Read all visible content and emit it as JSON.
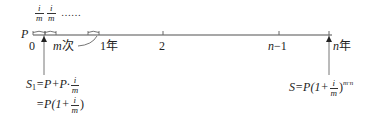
{
  "diagram": {
    "type": "timeline",
    "start_label": "P",
    "top_fractions": [
      {
        "numerator": "i",
        "denominator": "m"
      },
      {
        "numerator": "i",
        "denominator": "m"
      }
    ],
    "top_ellipsis": "……",
    "ticks": [
      {
        "label": "0",
        "x": 37
      },
      {
        "label": "1年",
        "x": 91
      },
      {
        "label": "2",
        "x": 163
      },
      {
        "label": "n−1",
        "x": 278
      },
      {
        "label": "n年",
        "x": 329
      }
    ],
    "period_label": "m次",
    "formula_left": {
      "line1_lhs": "S",
      "line1_sub": "1",
      "line1_rhs": "=P+P·",
      "frac_num": "i",
      "frac_den": "m",
      "line2_prefix": "=P(1+",
      "line2_suffix": ")"
    },
    "formula_right": {
      "prefix": "S=P(1+",
      "frac_num": "i",
      "frac_den": "m",
      "suffix": ")",
      "exponent": "m·n"
    },
    "colors": {
      "axis": "#888888",
      "text": "#222222"
    }
  }
}
